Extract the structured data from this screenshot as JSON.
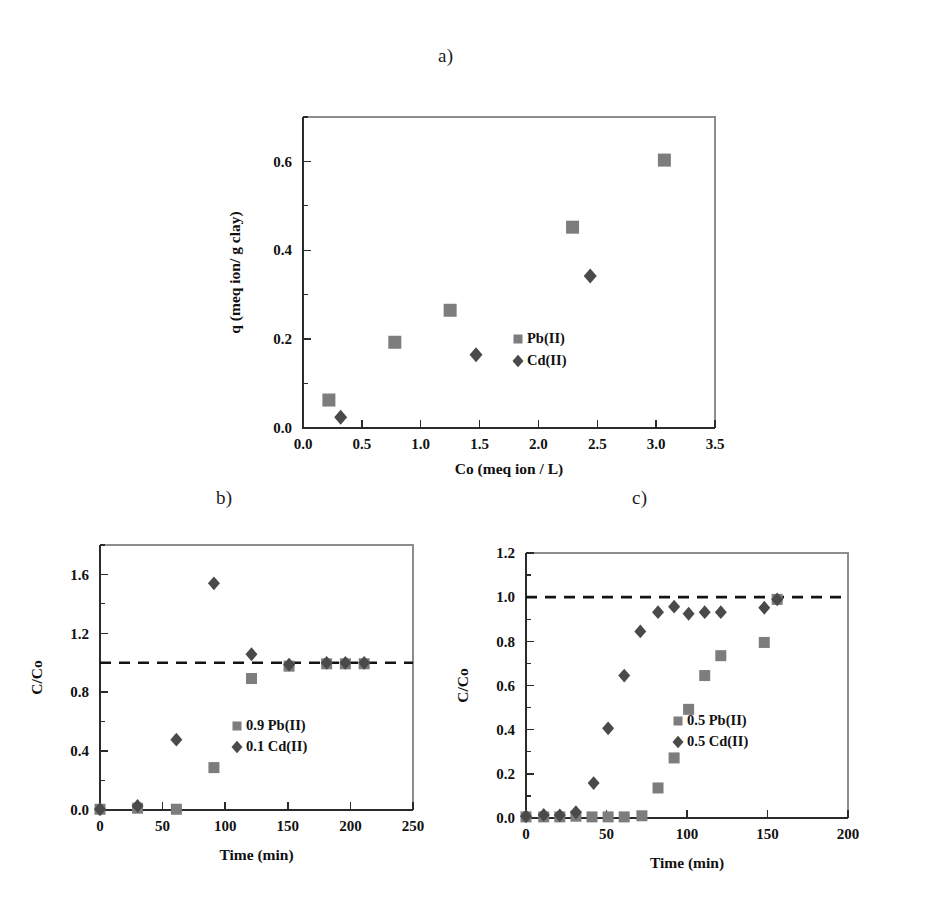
{
  "figure": {
    "panels": [
      {
        "id": "a",
        "label": "a)"
      },
      {
        "id": "b",
        "label": "b)"
      },
      {
        "id": "c",
        "label": "c)"
      }
    ],
    "marker_colors": {
      "pb_square": "#7d7d7d",
      "cd_diamond": "#4a4a4a",
      "axis": "#2b2b2b",
      "reference_line": "#141414"
    }
  },
  "chart_data": [
    {
      "id": "a",
      "panel_label": "a)",
      "type": "scatter",
      "title": "",
      "xlabel": "Co (meq ion / L)",
      "ylabel": "q (meq ion/ g clay)",
      "xlim": [
        0.0,
        3.5
      ],
      "ylim": [
        0.0,
        0.7
      ],
      "xticks": [
        0.0,
        0.5,
        1.0,
        1.5,
        2.0,
        2.5,
        3.0,
        3.5
      ],
      "xticklabels": [
        "0.0",
        "0.5",
        "1.0",
        "1.5",
        "2.0",
        "2.5",
        "3.0",
        "3.5"
      ],
      "yticks": [
        0.0,
        0.2,
        0.4,
        0.6
      ],
      "yticklabels": [
        "0.0",
        "0.2",
        "0.4",
        "0.6"
      ],
      "yminorticks": [
        0.1,
        0.3,
        0.5,
        0.7
      ],
      "grid": false,
      "legend_position": "lower-right",
      "series": [
        {
          "name": "Pb(II)",
          "marker": "square",
          "color": "#7d7d7d",
          "points": [
            [
              0.22,
              0.063
            ],
            [
              0.78,
              0.193
            ],
            [
              1.25,
              0.265
            ],
            [
              2.29,
              0.452
            ],
            [
              3.07,
              0.603
            ]
          ]
        },
        {
          "name": "Cd(II)",
          "marker": "diamond",
          "color": "#4a4a4a",
          "points": [
            [
              0.32,
              0.024
            ],
            [
              1.47,
              0.165
            ],
            [
              2.44,
              0.342
            ]
          ]
        }
      ]
    },
    {
      "id": "b",
      "panel_label": "b)",
      "type": "scatter",
      "title": "",
      "xlabel": "Time (min)",
      "ylabel": "C/Co",
      "xlim": [
        0,
        250
      ],
      "ylim": [
        0.0,
        1.8
      ],
      "xticks": [
        0,
        50,
        100,
        150,
        200,
        250
      ],
      "xticklabels": [
        "0",
        "50",
        "100",
        "150",
        "200",
        "250"
      ],
      "yticks": [
        0.0,
        0.4,
        0.8,
        1.2,
        1.6
      ],
      "yticklabels": [
        "0.0",
        "0.4",
        "0.8",
        "1.2",
        "1.6"
      ],
      "yminorticks": [
        0.2,
        0.6,
        1.0,
        1.4,
        1.8
      ],
      "grid": false,
      "legend_position": "lower-right",
      "reference_line": {
        "y": 1.0,
        "style": "dashed"
      },
      "series": [
        {
          "name": "0.9 Pb(II)",
          "marker": "square",
          "color": "#7d7d7d",
          "points": [
            [
              0,
              0.005
            ],
            [
              30,
              0.012
            ],
            [
              61,
              0.005
            ],
            [
              91,
              0.288
            ],
            [
              121,
              0.893
            ],
            [
              151,
              0.977
            ],
            [
              181,
              0.993
            ],
            [
              196,
              0.993
            ],
            [
              211,
              0.993
            ]
          ]
        },
        {
          "name": "0.1 Cd(II)",
          "marker": "diamond",
          "color": "#4a4a4a",
          "points": [
            [
              0,
              0.005
            ],
            [
              30,
              0.028
            ],
            [
              61,
              0.478
            ],
            [
              91,
              1.54
            ],
            [
              121,
              1.058
            ],
            [
              151,
              0.988
            ],
            [
              181,
              1.0
            ],
            [
              196,
              1.0
            ],
            [
              211,
              1.0
            ]
          ]
        }
      ]
    },
    {
      "id": "c",
      "panel_label": "c)",
      "type": "scatter",
      "title": "",
      "xlabel": "Time (min)",
      "ylabel": "C/Co",
      "xlim": [
        0,
        200
      ],
      "ylim": [
        0.0,
        1.2
      ],
      "xticks": [
        0,
        50,
        100,
        150,
        200
      ],
      "xticklabels": [
        "0",
        "50",
        "100",
        "150",
        "200"
      ],
      "yticks": [
        0.0,
        0.2,
        0.4,
        0.6,
        0.8,
        1.0,
        1.2
      ],
      "yticklabels": [
        "0.0",
        "0.2",
        "0.4",
        "0.6",
        "0.8",
        "1.0",
        "1.2"
      ],
      "yminorticks": [
        0.1,
        0.3,
        0.5,
        0.7,
        0.9,
        1.1
      ],
      "grid": false,
      "legend_position": "lower-right",
      "reference_line": {
        "y": 1.0,
        "style": "dashed"
      },
      "series": [
        {
          "name": "0.5 Pb(II)",
          "marker": "square",
          "color": "#7d7d7d",
          "points": [
            [
              0,
              0.005
            ],
            [
              11,
              0.005
            ],
            [
              21,
              0.005
            ],
            [
              31,
              0.008
            ],
            [
              41,
              0.005
            ],
            [
              51,
              0.005
            ],
            [
              61,
              0.005
            ],
            [
              72,
              0.01
            ],
            [
              82,
              0.136
            ],
            [
              92,
              0.272
            ],
            [
              101,
              0.492
            ],
            [
              111,
              0.645
            ],
            [
              121,
              0.735
            ],
            [
              148,
              0.795
            ],
            [
              156,
              0.99
            ]
          ]
        },
        {
          "name": "0.5 Cd(II)",
          "marker": "diamond",
          "color": "#4a4a4a",
          "points": [
            [
              0,
              0.008
            ],
            [
              11,
              0.014
            ],
            [
              21,
              0.012
            ],
            [
              31,
              0.026
            ],
            [
              42,
              0.158
            ],
            [
              51,
              0.406
            ],
            [
              61,
              0.645
            ],
            [
              71,
              0.845
            ],
            [
              82,
              0.932
            ],
            [
              92,
              0.957
            ],
            [
              101,
              0.925
            ],
            [
              111,
              0.932
            ],
            [
              121,
              0.932
            ],
            [
              148,
              0.952
            ],
            [
              156,
              0.99
            ]
          ]
        }
      ]
    }
  ]
}
